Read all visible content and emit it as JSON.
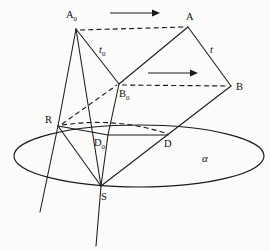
{
  "figure": {
    "background_color": "#fbfbf9",
    "ink_color": "#1a1a1a",
    "labels": {
      "a_zero": "A",
      "a_zero_sub": "0",
      "a": "A",
      "b_zero": "B",
      "b_zero_sub": "0",
      "b": "B",
      "r": "R",
      "d_zero": "D",
      "d_zero_sub": "0",
      "d": "D",
      "s": "S",
      "t_zero": "t",
      "t_zero_sub": "0",
      "t": "t",
      "alpha": "α"
    },
    "points": {
      "A0": {
        "x": 76,
        "y": 29,
        "label": "A₀"
      },
      "A": {
        "x": 188,
        "y": 27,
        "label": "A"
      },
      "B0": {
        "x": 119,
        "y": 84,
        "label": "B₀"
      },
      "B": {
        "x": 231,
        "y": 86,
        "label": "B"
      },
      "R": {
        "x": 58,
        "y": 126,
        "label": "R"
      },
      "D0": {
        "x": 108,
        "y": 135,
        "label": "D₀"
      },
      "D": {
        "x": 168,
        "y": 135,
        "label": "D"
      },
      "S": {
        "x": 101,
        "y": 186,
        "label": "S"
      }
    },
    "plane": {
      "name": "α",
      "center_x": 139,
      "center_y": 156,
      "radius_x": 125,
      "radius_y": 31
    },
    "arrows": [
      {
        "name": "upper-translation-arrow",
        "x1": 110,
        "y1": 13,
        "x2": 156,
        "y2": 13
      },
      {
        "name": "lower-translation-arrow",
        "x1": 148,
        "y1": 73,
        "x2": 194,
        "y2": 73
      }
    ],
    "segments": {
      "dashed": [
        "A0-A",
        "B0-B",
        "R-D",
        "R-B0"
      ],
      "solid": [
        "A0-B0",
        "A0-R",
        "A0-S",
        "A-B",
        "A-B0",
        "B-S",
        "R-S",
        "R-D0",
        "D0-D",
        "D0-S",
        "B0-D0",
        "S-extension",
        "R-extension"
      ]
    }
  }
}
